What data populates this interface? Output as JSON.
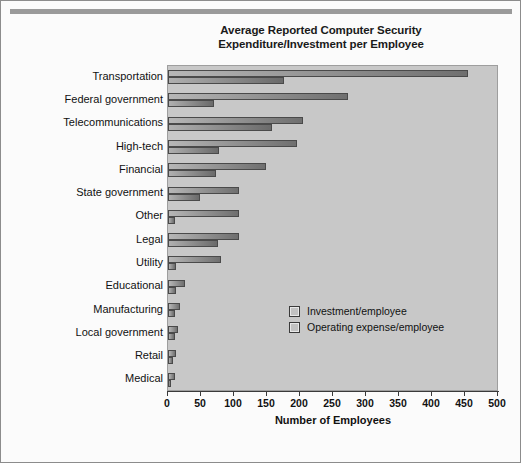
{
  "chart_data": {
    "type": "bar",
    "orientation": "horizontal",
    "title": "Average Reported Computer Security Expenditure/Investment per Employee",
    "title_line1": "Average Reported Computer Security",
    "title_line2": "Expenditure/Investment per Employee",
    "xlabel": "Number of Employees",
    "ylabel": "",
    "xlim": [
      0,
      500
    ],
    "xticks": [
      0,
      50,
      100,
      150,
      200,
      250,
      300,
      350,
      400,
      450,
      500
    ],
    "grid": false,
    "legend_position": "center-right",
    "categories": [
      "Transportation",
      "Federal government",
      "Telecommunications",
      "High-tech",
      "Financial",
      "State government",
      "Other",
      "Legal",
      "Utility",
      "Educational",
      "Manufacturing",
      "Local government",
      "Retail",
      "Medical"
    ],
    "series": [
      {
        "name": "Investment/employee",
        "values": [
          455,
          272,
          205,
          196,
          148,
          108,
          108,
          108,
          80,
          25,
          18,
          15,
          12,
          10
        ]
      },
      {
        "name": "Operating expense/employee",
        "values": [
          175,
          70,
          158,
          78,
          72,
          48,
          10,
          75,
          12,
          12,
          10,
          10,
          8,
          5
        ]
      }
    ]
  },
  "colors": {
    "plot_background": "#c8c8c8",
    "page_background": "#fbfbfb",
    "bar_dark": "#6f6f6f",
    "bar_light": "#b7b7b7",
    "bar_border": "#4a4a4a",
    "text": "#111111",
    "frame": "#9e9e9e",
    "topbar": "#9a9a9a"
  }
}
